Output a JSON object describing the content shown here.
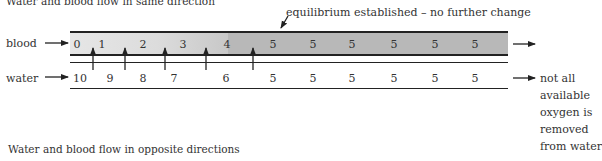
{
  "titles": {
    "same_direction": "Water and blood flow in same direction",
    "opposite_direction": "Water and blood flow in opposite directions"
  },
  "labels": {
    "blood": "blood",
    "water": "water",
    "equilibrium": "equilibrium established – no further change",
    "note_lines": [
      "not all",
      "available",
      "oxygen is",
      "removed",
      "from water"
    ]
  },
  "blood_values": [
    "0",
    "1",
    "2",
    "3",
    "4",
    "5",
    "5",
    "5",
    "5",
    "5",
    "5"
  ],
  "water_values": [
    "10",
    "9",
    "8",
    "7",
    "6",
    "5",
    "5",
    "5",
    "5",
    "5",
    "5"
  ],
  "colors": {
    "blood_start": "#e6e6e6",
    "blood_equilibrium": "#b8b8b8",
    "line": "#222222"
  }
}
